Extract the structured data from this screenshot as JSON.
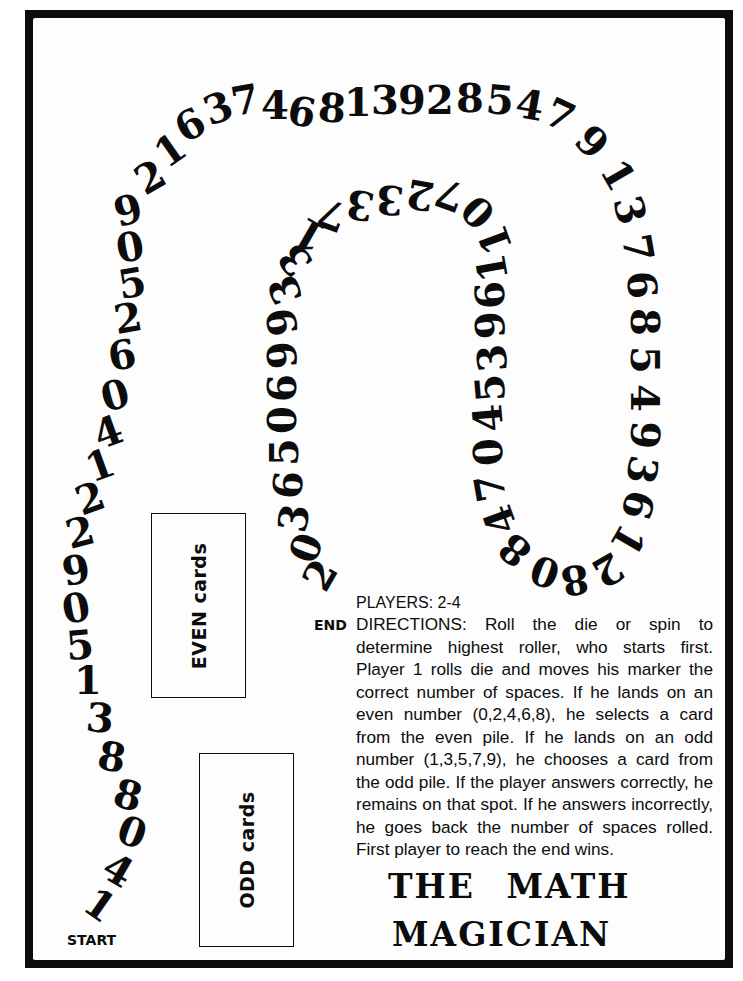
{
  "game": {
    "title_line1": "THE MATH",
    "title_line2": "MAGICIAN",
    "start_label": "START",
    "end_label": "END",
    "players": "PLAYERS: 2-4",
    "directions": "DIRECTIONS: Roll the die or spin to determine highest roller, who starts first. Player 1 rolls die and moves his marker the correct number of spaces. If he lands on an even number (0,2,4,6,8), he selects a card from the even pile. If he lands on an odd number (1,3,5,7,9), he chooses a card from the odd pile. If the player answers correctly, he remains on that spot. If he answers incorrectly, he goes back the number of spaces rolled. First player to reach the end wins."
  },
  "card_piles": {
    "even": "EVEN cards",
    "odd": "ODD cards"
  },
  "path": {
    "spaces": [
      {
        "d": "1",
        "x": 100,
        "y": 905,
        "r": 35
      },
      {
        "d": "4",
        "x": 118,
        "y": 870,
        "r": 30
      },
      {
        "d": "0",
        "x": 132,
        "y": 832,
        "r": 20
      },
      {
        "d": "8",
        "x": 128,
        "y": 795,
        "r": 15
      },
      {
        "d": "8",
        "x": 112,
        "y": 757,
        "r": 10
      },
      {
        "d": "3",
        "x": 100,
        "y": 718,
        "r": 5
      },
      {
        "d": "1",
        "x": 88,
        "y": 680,
        "r": 0
      },
      {
        "d": "5",
        "x": 80,
        "y": 645,
        "r": -5
      },
      {
        "d": "0",
        "x": 76,
        "y": 608,
        "r": -10
      },
      {
        "d": "9",
        "x": 76,
        "y": 570,
        "r": -10
      },
      {
        "d": "2",
        "x": 80,
        "y": 532,
        "r": -15
      },
      {
        "d": "2",
        "x": 90,
        "y": 498,
        "r": -20
      },
      {
        "d": "1",
        "x": 100,
        "y": 465,
        "r": -20
      },
      {
        "d": "4",
        "x": 108,
        "y": 432,
        "r": -20
      },
      {
        "d": "0",
        "x": 115,
        "y": 395,
        "r": -15
      },
      {
        "d": "6",
        "x": 122,
        "y": 355,
        "r": -10
      },
      {
        "d": "2",
        "x": 128,
        "y": 318,
        "r": -10
      },
      {
        "d": "5",
        "x": 132,
        "y": 283,
        "r": -10
      },
      {
        "d": "0",
        "x": 130,
        "y": 247,
        "r": -10
      },
      {
        "d": "9",
        "x": 128,
        "y": 210,
        "r": -15
      },
      {
        "d": "2",
        "x": 150,
        "y": 177,
        "r": -30
      },
      {
        "d": "1",
        "x": 170,
        "y": 150,
        "r": -35
      },
      {
        "d": "6",
        "x": 190,
        "y": 125,
        "r": -30
      },
      {
        "d": "3",
        "x": 218,
        "y": 108,
        "r": -20
      },
      {
        "d": "7",
        "x": 245,
        "y": 100,
        "r": -10
      },
      {
        "d": "4",
        "x": 275,
        "y": 105,
        "r": 0
      },
      {
        "d": "6",
        "x": 302,
        "y": 112,
        "r": 10
      },
      {
        "d": "8",
        "x": 332,
        "y": 108,
        "r": 5
      },
      {
        "d": "1",
        "x": 358,
        "y": 102,
        "r": 0
      },
      {
        "d": "3",
        "x": 385,
        "y": 100,
        "r": 0
      },
      {
        "d": "9",
        "x": 412,
        "y": 100,
        "r": 0
      },
      {
        "d": "2",
        "x": 440,
        "y": 100,
        "r": 0
      },
      {
        "d": "8",
        "x": 470,
        "y": 98,
        "r": 0
      },
      {
        "d": "5",
        "x": 500,
        "y": 100,
        "r": 5
      },
      {
        "d": "4",
        "x": 530,
        "y": 105,
        "r": 10
      },
      {
        "d": "7",
        "x": 560,
        "y": 115,
        "r": 25
      },
      {
        "d": "9",
        "x": 592,
        "y": 142,
        "r": 45
      },
      {
        "d": "1",
        "x": 618,
        "y": 175,
        "r": 60
      },
      {
        "d": "3",
        "x": 630,
        "y": 210,
        "r": 75
      },
      {
        "d": "7",
        "x": 638,
        "y": 248,
        "r": 80
      },
      {
        "d": "6",
        "x": 642,
        "y": 285,
        "r": 85
      },
      {
        "d": "8",
        "x": 645,
        "y": 322,
        "r": 90
      },
      {
        "d": "5",
        "x": 645,
        "y": 360,
        "r": 90
      },
      {
        "d": "4",
        "x": 645,
        "y": 398,
        "r": 90
      },
      {
        "d": "9",
        "x": 645,
        "y": 435,
        "r": 95
      },
      {
        "d": "3",
        "x": 642,
        "y": 470,
        "r": 100
      },
      {
        "d": "6",
        "x": 638,
        "y": 505,
        "r": 105
      },
      {
        "d": "1",
        "x": 628,
        "y": 540,
        "r": 120
      },
      {
        "d": "2",
        "x": 608,
        "y": 570,
        "r": 150
      },
      {
        "d": "8",
        "x": 575,
        "y": 580,
        "r": 170
      },
      {
        "d": "0",
        "x": 545,
        "y": 572,
        "r": -160
      },
      {
        "d": "8",
        "x": 515,
        "y": 550,
        "r": -140
      },
      {
        "d": "4",
        "x": 500,
        "y": 520,
        "r": -110
      },
      {
        "d": "7",
        "x": 490,
        "y": 488,
        "r": -100
      },
      {
        "d": "0",
        "x": 488,
        "y": 452,
        "r": -95
      },
      {
        "d": "4",
        "x": 488,
        "y": 418,
        "r": -95
      },
      {
        "d": "5",
        "x": 490,
        "y": 388,
        "r": -95
      },
      {
        "d": "3",
        "x": 492,
        "y": 358,
        "r": -95
      },
      {
        "d": "9",
        "x": 490,
        "y": 325,
        "r": -95
      },
      {
        "d": "6",
        "x": 490,
        "y": 295,
        "r": -95
      },
      {
        "d": "1",
        "x": 492,
        "y": 268,
        "r": -100
      },
      {
        "d": "1",
        "x": 495,
        "y": 240,
        "r": -110
      },
      {
        "d": "0",
        "x": 478,
        "y": 212,
        "r": -135
      },
      {
        "d": "7",
        "x": 450,
        "y": 195,
        "r": -160
      },
      {
        "d": "2",
        "x": 420,
        "y": 195,
        "r": -170
      },
      {
        "d": "3",
        "x": 390,
        "y": 200,
        "r": -175
      },
      {
        "d": "3",
        "x": 360,
        "y": 205,
        "r": -170
      },
      {
        "d": "7",
        "x": 332,
        "y": 215,
        "r": -160
      },
      {
        "d": "1",
        "x": 310,
        "y": 235,
        "r": -150
      },
      {
        "d": "3",
        "x": 295,
        "y": 260,
        "r": -130
      },
      {
        "d": "3",
        "x": 285,
        "y": 290,
        "r": -110
      },
      {
        "d": "9",
        "x": 282,
        "y": 322,
        "r": -100
      },
      {
        "d": "9",
        "x": 282,
        "y": 355,
        "r": -95
      },
      {
        "d": "6",
        "x": 282,
        "y": 388,
        "r": -90
      },
      {
        "d": "0",
        "x": 282,
        "y": 420,
        "r": -90
      },
      {
        "d": "5",
        "x": 284,
        "y": 452,
        "r": -90
      },
      {
        "d": "6",
        "x": 288,
        "y": 485,
        "r": -85
      },
      {
        "d": "3",
        "x": 294,
        "y": 518,
        "r": -80
      },
      {
        "d": "0",
        "x": 306,
        "y": 548,
        "r": -70
      },
      {
        "d": "2",
        "x": 320,
        "y": 575,
        "r": -60
      }
    ]
  },
  "colors": {
    "ink": "#0c0c0c",
    "paper": "#fdfdfd"
  }
}
